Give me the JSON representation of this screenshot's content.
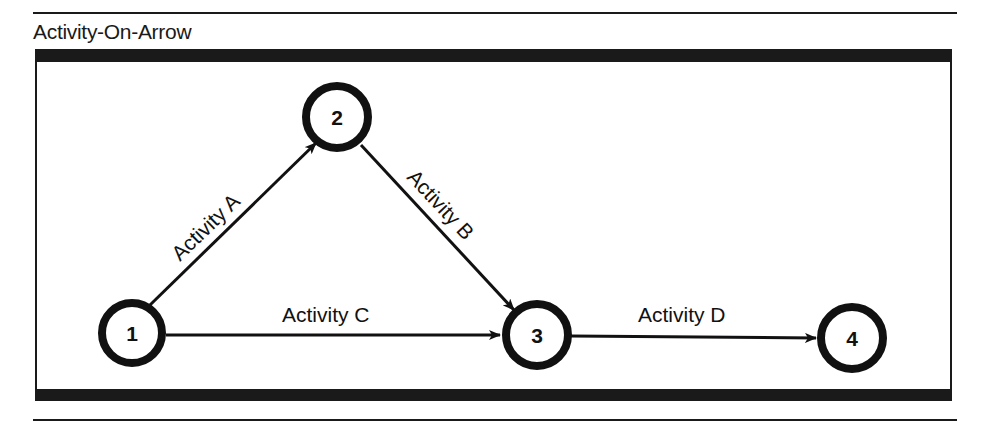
{
  "title": "Activity-On-Arrow",
  "nodes": [
    {
      "id": "1",
      "label": "1",
      "cx": 132,
      "cy": 333
    },
    {
      "id": "2",
      "label": "2",
      "cx": 337,
      "cy": 117
    },
    {
      "id": "3",
      "label": "3",
      "cx": 537,
      "cy": 335
    },
    {
      "id": "4",
      "label": "4",
      "cx": 852,
      "cy": 338
    }
  ],
  "edges": [
    {
      "id": "A",
      "from": "1",
      "to": "2",
      "label": "Activity A"
    },
    {
      "id": "B",
      "from": "2",
      "to": "3",
      "label": "Activity B"
    },
    {
      "id": "C",
      "from": "1",
      "to": "3",
      "label": "Activity C"
    },
    {
      "id": "D",
      "from": "3",
      "to": "4",
      "label": "Activity D"
    }
  ],
  "colors": {
    "ink": "#111111",
    "background": "#ffffff"
  }
}
